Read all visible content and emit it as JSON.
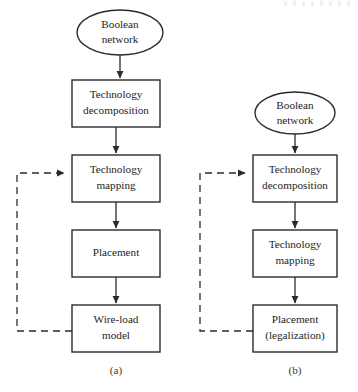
{
  "figure": {
    "background_color": "#ffffff",
    "line_color": "#2b2b2b",
    "text_color": "#242424"
  },
  "panels": [
    {
      "id": "a",
      "caption": "(a)",
      "start_node": {
        "label_line1": "Boolean",
        "label_line2": "network",
        "shape": "ellipse"
      },
      "steps": [
        {
          "label_line1": "Technology",
          "label_line2": "decomposition"
        },
        {
          "label_line1": "Technology",
          "label_line2": "mapping"
        },
        {
          "label_line1": "Placement",
          "label_line2": ""
        },
        {
          "label_line1": "Wire-load",
          "label_line2": "model"
        }
      ],
      "feedback": {
        "from_step_index": 3,
        "to_step_index": 1,
        "style": "dashed"
      }
    },
    {
      "id": "b",
      "caption": "(b)",
      "start_node": {
        "label_line1": "Boolean",
        "label_line2": "network",
        "shape": "ellipse"
      },
      "steps": [
        {
          "label_line1": "Technology",
          "label_line2": "decomposition"
        },
        {
          "label_line1": "Technology",
          "label_line2": "mapping"
        },
        {
          "label_line1": "Placement",
          "label_line2": "(legalization)"
        }
      ],
      "feedback": {
        "from_step_index": 2,
        "to_step_index": 0,
        "style": "dashed"
      }
    }
  ]
}
